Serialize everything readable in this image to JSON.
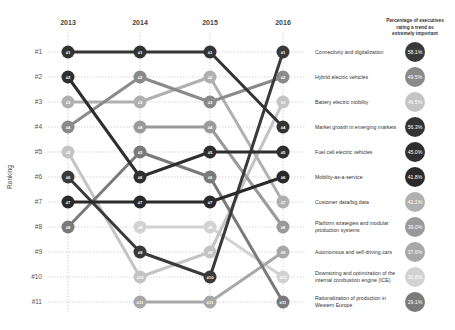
{
  "chart_data": {
    "type": "line",
    "subtype": "bump-chart",
    "title": "",
    "xlabel": "",
    "ylabel": "Ranking",
    "x": [
      "2013",
      "2014",
      "2015",
      "2016"
    ],
    "y_ticks": [
      "#1",
      "#2",
      "#3",
      "#4",
      "#5",
      "#6",
      "#7",
      "#8",
      "#9",
      "#10",
      "#11"
    ],
    "ylim": [
      1,
      11
    ],
    "y_inverted": true,
    "grid": true,
    "legend_title": "Percentage of executives rating a trend as extremely important",
    "series": [
      {
        "name": "Connectivity and digitalization",
        "ranks": [
          6,
          9,
          10,
          1
        ],
        "pct": "58.1%",
        "color": "#3a3a3a"
      },
      {
        "name": "Hybrid electric vehicles",
        "ranks": [
          4,
          2,
          3,
          2
        ],
        "pct": "49.5%",
        "color": "#8a8a8a"
      },
      {
        "name": "Battery electric mobility",
        "ranks": [
          5,
          10,
          9,
          3
        ],
        "pct": "46.5%",
        "color": "#c4c4c4"
      },
      {
        "name": "Market growth in emerging markets",
        "ranks": [
          1,
          1,
          1,
          4
        ],
        "pct": "56.3%",
        "color": "#333333"
      },
      {
        "name": "Fuel cell electric vehicles",
        "ranks": [
          2,
          6,
          5,
          5
        ],
        "pct": "45.0%",
        "color": "#2e2e2e"
      },
      {
        "name": "Mobility-as-a-service",
        "ranks": [
          7,
          7,
          7,
          6
        ],
        "pct": "41.8%",
        "color": "#2a2a2a"
      },
      {
        "name": "Customer data/big data",
        "ranks": [
          3,
          3,
          2,
          7
        ],
        "pct": "41.1%",
        "color": "#b0b0b0"
      },
      {
        "name": "Platform strategies and modular production systems",
        "ranks": [
          null,
          4,
          4,
          8
        ],
        "pct": "39.0%",
        "color": "#9a9a9a"
      },
      {
        "name": "Autonomous and self-driving cars",
        "ranks": [
          null,
          11,
          11,
          9
        ],
        "pct": "37.6%",
        "color": "#a8a8a8"
      },
      {
        "name": "Downsizing and optimization of the internal combustion engine (ICE)",
        "ranks": [
          null,
          8,
          8,
          10
        ],
        "pct": "30.8%",
        "color": "#d2d2d2"
      },
      {
        "name": "Rationalization of production in Western Europe",
        "ranks": [
          8,
          5,
          6,
          11
        ],
        "pct": "29.1%",
        "color": "#7a7a7a"
      }
    ]
  }
}
